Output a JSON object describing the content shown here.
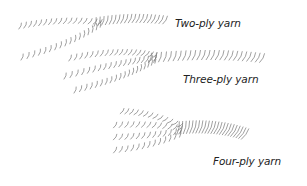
{
  "diagram": {
    "items": [
      {
        "label": "Two-ply yarn",
        "plies": 2
      },
      {
        "label": "Three-ply yarn",
        "plies": 3
      },
      {
        "label": "Four-ply yarn",
        "plies": 4
      }
    ],
    "colors": {
      "line": "#777777",
      "text": "#222222",
      "background": "#ffffff"
    }
  }
}
